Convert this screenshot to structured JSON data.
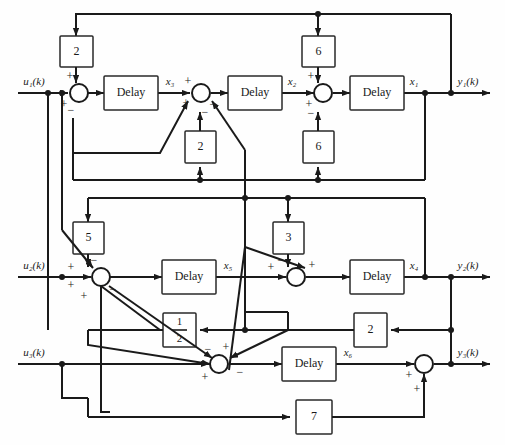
{
  "diagram": {
    "type": "signal-flow-block-diagram",
    "inputs": [
      {
        "id": "u1",
        "label": "u₁(k)"
      },
      {
        "id": "u2",
        "label": "u₂(k)"
      },
      {
        "id": "u3",
        "label": "u₃(k)"
      }
    ],
    "outputs": [
      {
        "id": "y1",
        "label": "y₁(k)"
      },
      {
        "id": "y2",
        "label": "y₂(k)"
      },
      {
        "id": "y3",
        "label": "y₃(k)"
      }
    ],
    "state_labels": [
      {
        "id": "x1",
        "label": "x₁"
      },
      {
        "id": "x2",
        "label": "x₂"
      },
      {
        "id": "x3",
        "label": "x₃"
      },
      {
        "id": "x4",
        "label": "x₄"
      },
      {
        "id": "x5",
        "label": "x₅"
      },
      {
        "id": "x6",
        "label": "x₆"
      }
    ],
    "delays": [
      {
        "id": "delay-x3",
        "label": "Delay"
      },
      {
        "id": "delay-x2",
        "label": "Delay"
      },
      {
        "id": "delay-x1",
        "label": "Delay"
      },
      {
        "id": "delay-x5",
        "label": "Delay"
      },
      {
        "id": "delay-x4",
        "label": "Delay"
      },
      {
        "id": "delay-x6",
        "label": "Delay"
      }
    ],
    "gains": [
      {
        "id": "gain-2-top-left",
        "label": "2"
      },
      {
        "id": "gain-6-top",
        "label": "6"
      },
      {
        "id": "gain-2-mid",
        "label": "2"
      },
      {
        "id": "gain-6-lower",
        "label": "6"
      },
      {
        "id": "gain-5",
        "label": "5"
      },
      {
        "id": "gain-3",
        "label": "3"
      },
      {
        "id": "gain-half",
        "label": "1/2",
        "numerator": "1",
        "denominator": "2"
      },
      {
        "id": "gain-2-right",
        "label": "2"
      },
      {
        "id": "gain-7",
        "label": "7"
      }
    ],
    "signs": {
      "plus": "+",
      "minus": "−"
    },
    "summers": [
      {
        "id": "sum-u1",
        "signs": [
          "+",
          "+",
          "−"
        ]
      },
      {
        "id": "sum-x2in",
        "signs": [
          "+",
          "+",
          "−",
          "−"
        ]
      },
      {
        "id": "sum-x1in",
        "signs": [
          "+",
          "+",
          "−"
        ]
      },
      {
        "id": "sum-u2",
        "signs": [
          "−",
          "+",
          "+",
          "+",
          "−"
        ]
      },
      {
        "id": "sum-x4in",
        "signs": [
          "+",
          "−",
          "+"
        ]
      },
      {
        "id": "sum-u3",
        "signs": [
          "−",
          "+",
          "+",
          "−"
        ]
      },
      {
        "id": "sum-y3",
        "signs": [
          "+",
          "+"
        ]
      }
    ],
    "colors": {
      "line": "#1a1a1a",
      "block_fill": "#ffffff",
      "block_stroke": "#2a2a2a",
      "background": "#ffffff"
    }
  }
}
